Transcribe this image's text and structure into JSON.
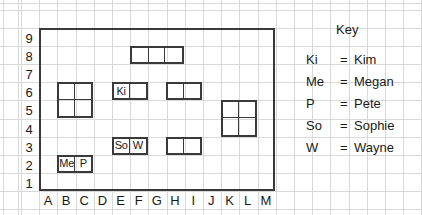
{
  "grid": {
    "x_labels": [
      "A",
      "B",
      "C",
      "D",
      "E",
      "F",
      "G",
      "H",
      "I",
      "J",
      "K",
      "L",
      "M"
    ],
    "y_labels": [
      "9",
      "8",
      "7",
      "6",
      "5",
      "4",
      "3",
      "2",
      "1"
    ],
    "columns": 13,
    "rows": 9,
    "border_color": "#3a3a3a",
    "paper_color": "#d9d9d9"
  },
  "key": {
    "title": "Key",
    "entries": [
      {
        "abbr": "Ki",
        "eq": "=",
        "name": "Kim"
      },
      {
        "abbr": "Me",
        "eq": "=",
        "name": "Megan"
      },
      {
        "abbr": "P",
        "eq": "=",
        "name": "Pete"
      },
      {
        "abbr": "So",
        "eq": "=",
        "name": "Sophie"
      },
      {
        "abbr": "W",
        "eq": "=",
        "name": "Wayne"
      }
    ]
  },
  "ships": [
    {
      "id": "ship-row8-fgh",
      "cols": [
        "F",
        "G",
        "H"
      ],
      "rows": [
        "8"
      ],
      "width_cells": 3,
      "height_cells": 1,
      "labels": [
        "",
        "",
        ""
      ]
    },
    {
      "id": "ship-bc-56",
      "cols": [
        "B",
        "C"
      ],
      "rows": [
        "6",
        "5"
      ],
      "width_cells": 2,
      "height_cells": 2,
      "labels": [
        "",
        "",
        "",
        ""
      ]
    },
    {
      "id": "ship-row6-ef-kim",
      "cols": [
        "E",
        "F"
      ],
      "rows": [
        "6"
      ],
      "width_cells": 2,
      "height_cells": 1,
      "labels": [
        "Ki",
        ""
      ]
    },
    {
      "id": "ship-row6-hi",
      "cols": [
        "H",
        "I"
      ],
      "rows": [
        "6"
      ],
      "width_cells": 2,
      "height_cells": 1,
      "labels": [
        "",
        ""
      ]
    },
    {
      "id": "ship-kl-45",
      "cols": [
        "K",
        "L"
      ],
      "rows": [
        "5",
        "4"
      ],
      "width_cells": 2,
      "height_cells": 2,
      "labels": [
        "",
        "",
        "",
        ""
      ]
    },
    {
      "id": "ship-row3-ef-sophie-wayne",
      "cols": [
        "E",
        "F"
      ],
      "rows": [
        "3"
      ],
      "width_cells": 2,
      "height_cells": 1,
      "labels": [
        "So",
        "W"
      ]
    },
    {
      "id": "ship-row3-hi",
      "cols": [
        "H",
        "I"
      ],
      "rows": [
        "3"
      ],
      "width_cells": 2,
      "height_cells": 1,
      "labels": [
        "",
        ""
      ]
    },
    {
      "id": "ship-row2-bc-megan-pete",
      "cols": [
        "B",
        "C"
      ],
      "rows": [
        "2"
      ],
      "width_cells": 2,
      "height_cells": 1,
      "labels": [
        "Me",
        "P"
      ]
    }
  ]
}
